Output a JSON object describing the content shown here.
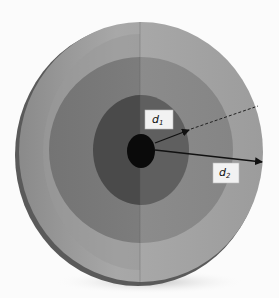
{
  "figure": {
    "type": "concentric-disc-diagram",
    "labels": {
      "d1": {
        "base": "d",
        "sub": "1"
      },
      "d2": {
        "base": "d",
        "sub": "2"
      }
    },
    "colors": {
      "background": "#fbfbfb",
      "outer_left": "#9a9a9a",
      "outer_right": "#a9a9a9",
      "middle_left": "#7d7d7d",
      "middle_right": "#8c8c8c",
      "inner_left": "#4a4a4a",
      "inner_right": "#5e5e5e",
      "center": "#0a0a0a",
      "arrow": "#111111",
      "label_box": "#f2f2f2"
    }
  }
}
